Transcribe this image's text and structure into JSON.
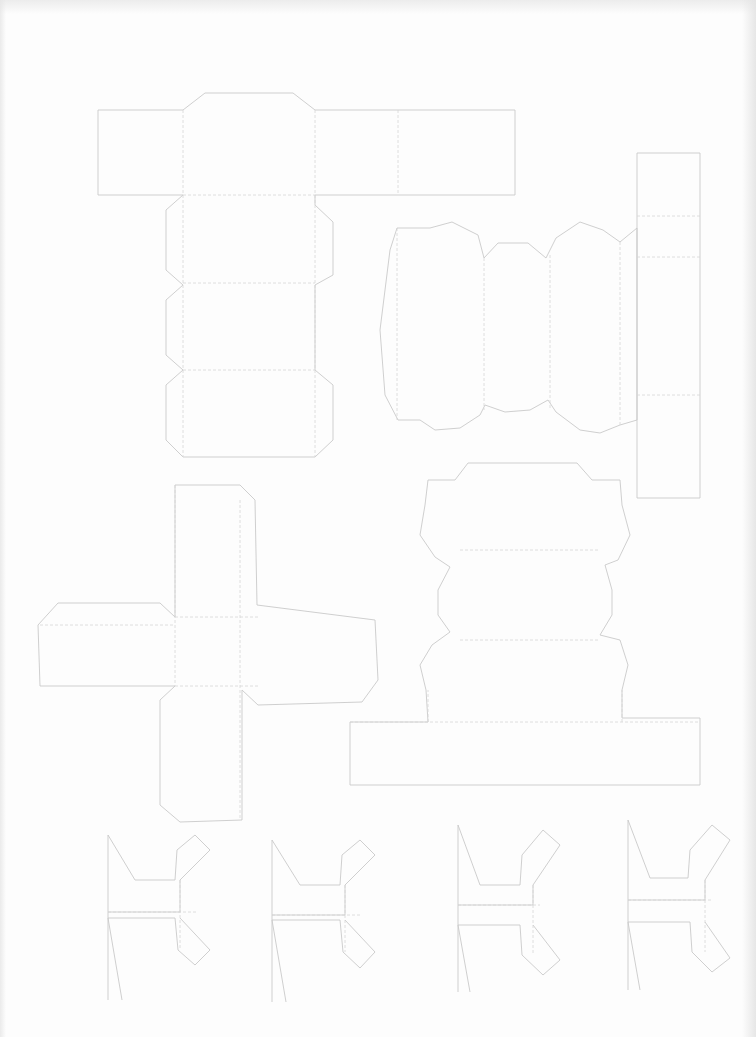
{
  "page": {
    "width": 756,
    "height": 1037,
    "background": "#fdfdfd",
    "line_color": "#c9c9c9",
    "fold_color": "#d6d6d6"
  },
  "pieces": [
    {
      "id": "top-left-box-net",
      "cut": [
        "M98,110 L183,110 L205,93 L293,93 L315,110 L515,110 L515,195 L315,195 L315,205 L333,222 L333,275 L315,285 L315,370 L333,385 L333,440 L315,457 L183,457 L166,440 L166,385 L183,370 L166,355 L166,300 L183,285 L166,270 L166,210 L183,195 L98,195 Z"
      ],
      "fold": [
        "M183,110 L183,457",
        "M315,110 L315,457",
        "M398,110 L398,195",
        "M183,195 L315,195",
        "M183,283 L315,283",
        "M183,370 L315,370"
      ]
    },
    {
      "id": "scalloped-cylinder-net",
      "cut": [
        "M397,228 L430,228 L452,222 L478,235 L484,258 L498,243 L528,243 L546,258 L556,238 L580,222 L603,230 L620,242 L637,228 L637,420 L620,425 L600,433 L580,430 L556,412 L548,400 L530,410 L505,412 L485,405 L480,415 L460,428 L435,430 L420,420 L398,420 L385,395 L380,330 L390,250 Z"
      ],
      "fold": [
        "M397,228 L397,420",
        "M484,258 L484,410",
        "M550,255 L550,410",
        "M620,242 L620,425"
      ]
    },
    {
      "id": "tall-right-strip",
      "cut": [
        "M637,153 L700,153 L700,498 L637,498 Z"
      ],
      "fold": [
        "M637,216 L700,216",
        "M637,257 L700,257",
        "M637,395 L700,395"
      ]
    },
    {
      "id": "cross-box-net",
      "cut": [
        "M175,485 L240,485 L255,500 L257,605 L375,620 L378,680 L362,702 L258,705 L242,690 L242,820 L180,822 L160,805 L160,700 L175,686 L40,686 L38,625 L58,603 L160,603 L175,617 Z"
      ],
      "fold": [
        "M175,485 L175,686",
        "M240,500 L240,820",
        "M40,625 L175,625",
        "M175,617 L258,617",
        "M175,686 L258,686"
      ]
    },
    {
      "id": "scalloped-pedestal-net",
      "cut": [
        "M428,480 L455,480 L468,463 L577,463 L592,480 L620,480 L622,505 L630,535 L618,560 L605,565 L612,590 L612,615 L600,635 L620,640 L628,665 L622,690 L622,718 L700,718 L700,785 L350,785 L350,722 L428,722 L426,690 L420,665 L432,645 L450,632 L438,615 L438,590 L450,567 L435,557 L420,535 L425,505 Z"
      ],
      "fold": [
        "M350,722 L700,722",
        "M428,722 L428,690",
        "M622,722 L622,690",
        "M460,550 L600,550",
        "M460,640 L600,640"
      ]
    },
    {
      "id": "h-piece-1",
      "cut": [
        "M108,835 L135,880 L175,880 L177,850 L195,835 L210,850 L180,880 L180,912 L108,912",
        "M108,918 L175,918 L178,950 L195,965 L210,950 L180,918",
        "M108,918 L122,1000",
        "M108,835 L108,1000"
      ],
      "fold": [
        "M108,912 L198,912",
        "M180,880 L180,950"
      ]
    },
    {
      "id": "h-piece-2",
      "cut": [
        "M272,840 L300,885 L340,885 L342,855 L360,840 L375,855 L345,885 L345,915 L272,915",
        "M272,920 L340,920 L343,952 L360,968 L375,952 L345,920",
        "M272,920 L286,1002",
        "M272,840 L272,1002"
      ],
      "fold": [
        "M272,915 L362,915",
        "M345,885 L345,952"
      ]
    },
    {
      "id": "h-piece-3",
      "cut": [
        "M458,825 L480,885 L520,885 L522,855 L543,830 L560,845 L533,885 L533,905 L458,905",
        "M458,925 L520,925 L522,955 L543,975 L560,960 L533,925",
        "M458,925 L470,992",
        "M458,825 L458,992"
      ],
      "fold": [
        "M458,905 L540,905",
        "M533,885 L533,955"
      ]
    },
    {
      "id": "h-piece-4",
      "cut": [
        "M628,820 L650,878 L688,878 L690,850 L712,825 L730,840 L705,880 L705,900 L628,900",
        "M628,922 L690,922 L692,952 L712,972 L730,958 L705,922",
        "M628,922 L640,990",
        "M628,820 L628,990"
      ],
      "fold": [
        "M628,900 L712,900",
        "M705,880 L705,952"
      ]
    }
  ]
}
